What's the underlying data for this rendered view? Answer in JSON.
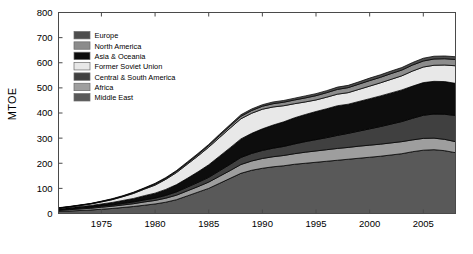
{
  "chart_data": {
    "type": "area",
    "title": "",
    "subtitle": "",
    "xlabel": "",
    "ylabel": "MTOE",
    "stacked": true,
    "grid": false,
    "legend_position": "top-left",
    "xlim": [
      1971,
      2008
    ],
    "ylim": [
      0,
      800
    ],
    "ytick_labels": [
      "0",
      "100",
      "200",
      "300",
      "400",
      "500",
      "600",
      "700",
      "800"
    ],
    "yticks": [
      0,
      100,
      200,
      300,
      400,
      500,
      600,
      700,
      800
    ],
    "xtick_labels": [
      "1975",
      "1980",
      "1985",
      "1990",
      "1995",
      "2000",
      "2005"
    ],
    "xticks": [
      1975,
      1980,
      1985,
      1990,
      1995,
      2000,
      2005
    ],
    "x": [
      1971,
      1972,
      1973,
      1974,
      1975,
      1976,
      1977,
      1978,
      1979,
      1980,
      1981,
      1982,
      1983,
      1984,
      1985,
      1986,
      1987,
      1988,
      1989,
      1990,
      1991,
      1992,
      1993,
      1994,
      1995,
      1996,
      1997,
      1998,
      1999,
      2000,
      2001,
      2002,
      2003,
      2004,
      2005,
      2006,
      2007,
      2008
    ],
    "series": [
      {
        "name": "Middle East",
        "color": "#595959",
        "values": [
          8,
          10,
          12,
          14,
          17,
          20,
          24,
          28,
          33,
          38,
          45,
          55,
          70,
          85,
          100,
          120,
          140,
          160,
          172,
          180,
          186,
          190,
          196,
          200,
          204,
          208,
          212,
          216,
          220,
          224,
          228,
          233,
          238,
          246,
          252,
          254,
          250,
          242
        ]
      },
      {
        "name": "Africa",
        "color": "#9e9e9e",
        "values": [
          4,
          5,
          6,
          7,
          8,
          9,
          10,
          11,
          13,
          14,
          16,
          18,
          20,
          22,
          25,
          28,
          31,
          35,
          37,
          39,
          40,
          41,
          42,
          44,
          45,
          46,
          47,
          47,
          48,
          48,
          48,
          48,
          48,
          47,
          47,
          46,
          45,
          44
        ]
      },
      {
        "name": "Central & South America",
        "color": "#404040",
        "values": [
          3,
          3,
          4,
          4,
          5,
          5,
          6,
          7,
          8,
          9,
          11,
          13,
          15,
          17,
          19,
          22,
          25,
          28,
          30,
          32,
          34,
          36,
          39,
          42,
          45,
          48,
          52,
          56,
          60,
          65,
          70,
          75,
          80,
          86,
          92,
          96,
          100,
          104
        ]
      },
      {
        "name": "Asia & Oceania",
        "color": "#0d0d0d",
        "values": [
          4,
          5,
          6,
          7,
          8,
          10,
          12,
          14,
          17,
          20,
          24,
          29,
          35,
          42,
          50,
          58,
          66,
          74,
          80,
          86,
          92,
          98,
          104,
          108,
          112,
          115,
          118,
          116,
          118,
          120,
          122,
          124,
          126,
          128,
          130,
          130,
          130,
          128
        ]
      },
      {
        "name": "Former Soviet Union",
        "color": "#e8e8e8",
        "values": [
          2,
          3,
          4,
          6,
          8,
          11,
          15,
          20,
          26,
          32,
          40,
          48,
          56,
          63,
          70,
          74,
          78,
          80,
          80,
          78,
          72,
          64,
          56,
          50,
          46,
          46,
          46,
          46,
          48,
          50,
          52,
          54,
          56,
          60,
          62,
          64,
          66,
          70
        ]
      },
      {
        "name": "North America",
        "color": "#8c8c8c",
        "values": [
          1,
          1,
          1,
          1,
          2,
          2,
          2,
          3,
          3,
          4,
          4,
          5,
          5,
          6,
          7,
          8,
          9,
          10,
          11,
          12,
          13,
          14,
          15,
          16,
          17,
          18,
          19,
          20,
          21,
          22,
          22,
          23,
          23,
          24,
          24,
          25,
          25,
          25
        ]
      },
      {
        "name": "Europe",
        "color": "#4d4d4d",
        "values": [
          1,
          1,
          1,
          1,
          1,
          2,
          2,
          2,
          2,
          3,
          3,
          3,
          4,
          4,
          4,
          5,
          5,
          6,
          6,
          6,
          7,
          7,
          7,
          8,
          8,
          8,
          9,
          9,
          9,
          10,
          10,
          10,
          10,
          10,
          11,
          11,
          11,
          11
        ]
      }
    ]
  },
  "legend": {
    "items": [
      {
        "label": "Europe",
        "color": "#4d4d4d"
      },
      {
        "label": "North America",
        "color": "#8c8c8c"
      },
      {
        "label": "Asia & Oceania",
        "color": "#0d0d0d"
      },
      {
        "label": "Former Soviet Union",
        "color": "#e8e8e8"
      },
      {
        "label": "Central & South America",
        "color": "#404040"
      },
      {
        "label": "Africa",
        "color": "#9e9e9e"
      },
      {
        "label": "Middle East",
        "color": "#595959"
      }
    ]
  },
  "axis": {
    "y_title": "MTOE",
    "outline_color": "#4a4a4a"
  }
}
